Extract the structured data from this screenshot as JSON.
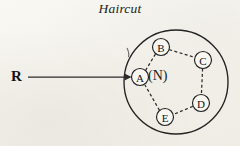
{
  "figure": {
    "title": "Haircut",
    "background_color": "#f6f4ef",
    "ink_color": "#222222",
    "external_label": "R",
    "inner_label": "(N)",
    "style": {
      "edge_style": "dashed",
      "boundary_style": "solid",
      "ray_style": "solid-with-arrowhead"
    },
    "boundary": {
      "name": "neighborhood-boundary",
      "shape": "circle",
      "cx": 176,
      "cy": 82,
      "r": 52
    },
    "ray": {
      "name": "root-ray",
      "from_label": "R",
      "to_node": "A",
      "x1": 28,
      "y1": 77,
      "x2": 133,
      "y2": 77
    },
    "nodes": [
      {
        "id": "A",
        "label": "A",
        "cx": 140,
        "cy": 77,
        "r": 8.5,
        "circled": true
      },
      {
        "id": "B",
        "label": "B",
        "cx": 161,
        "cy": 47,
        "r": 8.5,
        "circled": true
      },
      {
        "id": "C",
        "label": "C",
        "cx": 203,
        "cy": 60,
        "r": 8.5,
        "circled": true
      },
      {
        "id": "D",
        "label": "D",
        "cx": 201,
        "cy": 103,
        "r": 8.5,
        "circled": true
      },
      {
        "id": "E",
        "label": "E",
        "cx": 165,
        "cy": 117,
        "r": 8.5,
        "circled": true
      }
    ],
    "edges": [
      {
        "from": "A",
        "to": "B",
        "style": "dashed"
      },
      {
        "from": "B",
        "to": "C",
        "style": "dashed"
      },
      {
        "from": "C",
        "to": "D",
        "style": "dashed"
      },
      {
        "from": "D",
        "to": "E",
        "style": "dashed"
      },
      {
        "from": "E",
        "to": "A",
        "style": "dashed"
      }
    ]
  }
}
